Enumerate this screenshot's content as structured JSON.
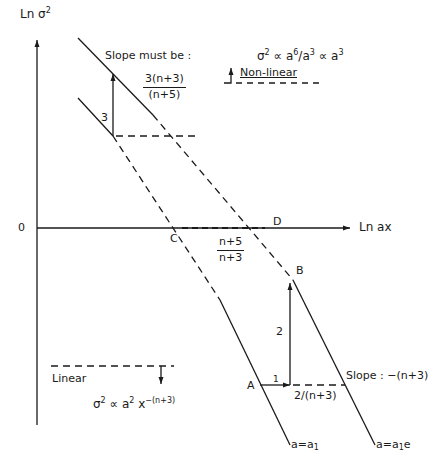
{
  "diagram": {
    "axes": {
      "y_label": "Ln σ",
      "y_label_sup": "2",
      "x_label": "Ln ax",
      "origin_label": "0"
    },
    "points": {
      "A": "A",
      "B": "B",
      "C": "C",
      "D": "D"
    },
    "lines": {
      "left_line_label_pre": "a=a",
      "left_line_label_sub": "1",
      "right_line_label_pre": "a=a",
      "right_line_label_sub": "1",
      "right_line_label_post": "e"
    },
    "annotations": {
      "slope_must_be": "Slope must be :",
      "slope_must_be_num": "3(n+3)",
      "slope_must_be_den": "(n+5)",
      "rise_3": "3",
      "cd_num": "n+5",
      "cd_den": "n+3",
      "rise_2": "2",
      "run_1": "1",
      "run_label": "2/(n+3)",
      "slope_right": "Slope : −(n+3)",
      "non_linear": "Non-linear",
      "linear": "Linear"
    },
    "formulas": {
      "nonlinear_a": "σ",
      "nonlinear_a_sup": "2",
      "nonlinear_b": " ∝ a",
      "nonlinear_b_sup": "6",
      "nonlinear_c": "/a",
      "nonlinear_c_sup": "3",
      "nonlinear_d": " ∝ a",
      "nonlinear_d_sup": "3",
      "linear_a": "σ",
      "linear_a_sup": "2",
      "linear_b": " ∝ a",
      "linear_b_sup": "2",
      "linear_c": " x",
      "linear_c_sup": "−(n+3)"
    }
  }
}
